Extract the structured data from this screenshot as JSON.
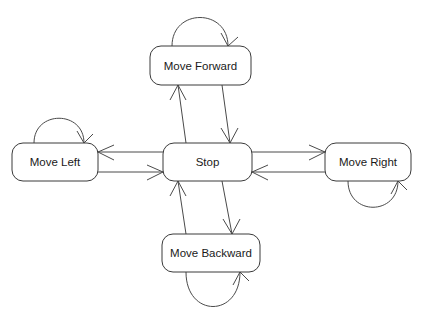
{
  "diagram": {
    "type": "state-machine",
    "background_color": "#ffffff",
    "line_color": "#4a4a4a",
    "text_color": "#1a1a1a",
    "states": [
      {
        "id": "move_forward",
        "label": "Move Forward",
        "x": 150,
        "y": 46,
        "w": 101,
        "h": 39,
        "self_loop": "top"
      },
      {
        "id": "move_left",
        "label": "Move Left",
        "x": 12,
        "y": 143,
        "w": 86,
        "h": 38,
        "self_loop": "top"
      },
      {
        "id": "stop",
        "label": "Stop",
        "x": 163,
        "y": 143,
        "w": 89,
        "h": 38,
        "self_loop": "none"
      },
      {
        "id": "move_right",
        "label": "Move Right",
        "x": 325,
        "y": 143,
        "w": 86,
        "h": 38,
        "self_loop": "bottom"
      },
      {
        "id": "move_backward",
        "label": "Move Backward",
        "x": 162,
        "y": 234,
        "w": 98,
        "h": 38,
        "self_loop": "bottom"
      }
    ],
    "transitions": [
      {
        "from": "stop",
        "to": "move_forward",
        "direction": "up"
      },
      {
        "from": "move_forward",
        "to": "stop",
        "direction": "down"
      },
      {
        "from": "stop",
        "to": "move_left",
        "direction": "left"
      },
      {
        "from": "move_left",
        "to": "stop",
        "direction": "right"
      },
      {
        "from": "stop",
        "to": "move_right",
        "direction": "right"
      },
      {
        "from": "move_right",
        "to": "stop",
        "direction": "left"
      },
      {
        "from": "stop",
        "to": "move_backward",
        "direction": "down"
      },
      {
        "from": "move_backward",
        "to": "stop",
        "direction": "up"
      },
      {
        "from": "move_forward",
        "to": "move_forward",
        "direction": "self"
      },
      {
        "from": "move_left",
        "to": "move_left",
        "direction": "self"
      },
      {
        "from": "move_right",
        "to": "move_right",
        "direction": "self"
      },
      {
        "from": "move_backward",
        "to": "move_backward",
        "direction": "self"
      }
    ]
  }
}
